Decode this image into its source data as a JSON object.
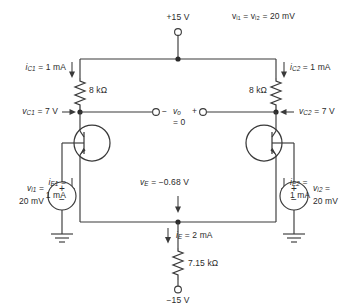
{
  "diagram": {
    "colors": {
      "ink": "#3a3a3a",
      "text": "#2b2b2b",
      "paper": "#ffffff"
    }
  },
  "supplies": {
    "positive": "+15 V",
    "negative": "−15 V"
  },
  "note": {
    "common_mode_input": "vᵢ₁ = vᵢ₂ = 20 mV",
    "v_label": "v",
    "i1_sub": "i1",
    "i2_sub": "i2",
    "eq_value": "= 20 mV"
  },
  "components": {
    "rc1": {
      "name": "collector-resistor-left",
      "value": "8 kΩ"
    },
    "rc2": {
      "name": "collector-resistor-right",
      "value": "8 kΩ"
    },
    "re": {
      "name": "emitter-bias-resistor",
      "value": "7.15 kΩ"
    },
    "q1": {
      "name": "transistor-q1",
      "type": "npn"
    },
    "q2": {
      "name": "transistor-q2",
      "type": "npn"
    }
  },
  "currents": {
    "ic1": {
      "symbol": "i",
      "sub": "C1",
      "value": "= 1 mA",
      "full": "i_C1 = 1 mA",
      "direction": "down"
    },
    "ic2": {
      "symbol": "i",
      "sub": "C2",
      "value": "= 1 mA",
      "full": "i_C2 = 1 mA",
      "direction": "down"
    },
    "ie1": {
      "symbol": "i",
      "sub": "E1",
      "value": "1 mA",
      "eq": "=",
      "full": "i_E1 = 1 mA",
      "direction": "down"
    },
    "ie2": {
      "symbol": "i",
      "sub": "E2",
      "value": "1 mA",
      "eq": "=",
      "full": "i_E2 = 1 mA",
      "direction": "down"
    },
    "ie": {
      "symbol": "i",
      "sub": "E",
      "value": "= 2 mA",
      "full": "i_E = 2 mA",
      "direction": "down"
    }
  },
  "voltages": {
    "vc1": {
      "symbol": "v",
      "sub": "C1",
      "value": "= 7 V",
      "full": "v_C1 = 7 V"
    },
    "vc2": {
      "symbol": "v",
      "sub": "C2",
      "value": "= 7 V",
      "full": "v_C2 = 7 V"
    },
    "ve": {
      "symbol": "v",
      "sub": "E",
      "value": "= −0.68 V",
      "full": "v_E = −0.68 V"
    },
    "vo": {
      "symbol": "v",
      "sub": "o",
      "value": "= 0",
      "minus": "−",
      "plus": "+",
      "full": "v_o = 0"
    }
  },
  "sources": {
    "vi1": {
      "name": "input-source-left",
      "label_line1": "v",
      "label_sub": "i1",
      "label_eq": "=",
      "value": "20 mV",
      "plus": "+",
      "minus": "−"
    },
    "vi2": {
      "name": "input-source-right",
      "label_line1": "v",
      "label_sub": "i2",
      "label_eq": "=",
      "value": "20 mV",
      "plus": "+",
      "minus": "−"
    }
  },
  "terminals": {
    "vo_left_marker": "−",
    "vo_right_marker": "+"
  }
}
